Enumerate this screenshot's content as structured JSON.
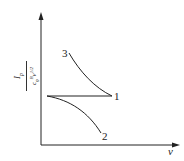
{
  "diagram": {
    "y_axis_label": {
      "numerator": "I",
      "numerator_sub": "p",
      "denominator": "c",
      "denominator_sub": "0",
      "denominator_sup": "B",
      "denominator_rest": "v",
      "denominator_rest_sup": "1/2"
    },
    "x_axis_label": "v",
    "curves": [
      {
        "id": "1",
        "label": "1",
        "shape": "horizontal line"
      },
      {
        "id": "2",
        "label": "2",
        "shape": "decreasing curve below line 1"
      },
      {
        "id": "3",
        "label": "3",
        "shape": "decreasing curve above line 1"
      }
    ],
    "colors": {
      "ink": "#222222",
      "background": "#ffffff"
    }
  }
}
